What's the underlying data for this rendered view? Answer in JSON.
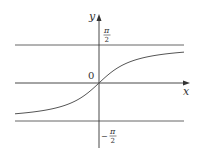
{
  "chart_data": {
    "type": "line",
    "title": "",
    "function": "y = arctan(x)",
    "xlabel": "x",
    "ylabel": "y",
    "origin_label": "0",
    "asymptotes": [
      {
        "value": "π/2",
        "label_num": "π",
        "label_den": "2",
        "sign": ""
      },
      {
        "value": "-π/2",
        "label_num": "π",
        "label_den": "2",
        "sign": "−"
      }
    ],
    "x": [
      -3.3,
      -2,
      -1,
      -0.5,
      0,
      0.5,
      1,
      2,
      3.3
    ],
    "y": [
      -1.276,
      -1.107,
      -0.785,
      -0.464,
      0,
      0.464,
      0.785,
      1.107,
      1.276
    ],
    "grid": false,
    "legend": null
  },
  "colors": {
    "axis": "#333333",
    "curve": "#555555",
    "asymptote": "#555555",
    "background": "#ffffff"
  }
}
